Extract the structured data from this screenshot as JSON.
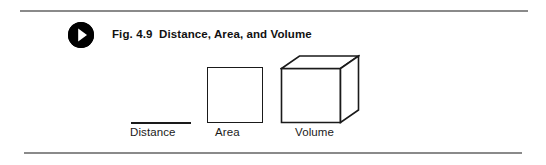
{
  "figure": {
    "badge_icon": "play-triangle-icon",
    "title": "Fig. 4.9  Distance, Area, and Volume",
    "colors": {
      "rule": "#8a8a8a",
      "ink": "#1a1a1a",
      "badge": "#000000",
      "background": "#ffffff"
    },
    "items": [
      {
        "id": "distance",
        "shape": "line",
        "label": "Distance"
      },
      {
        "id": "area",
        "shape": "square",
        "label": "Area"
      },
      {
        "id": "volume",
        "shape": "cube",
        "label": "Volume"
      }
    ]
  }
}
